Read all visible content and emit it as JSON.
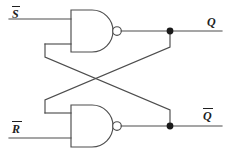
{
  "diagram": {
    "type": "logic-circuit-schematic",
    "colors": {
      "background": "#ffffff",
      "wire": "#4d4d4d",
      "junction": "#1a1a1a",
      "label_text": "#1f1f1f"
    },
    "inputs": [
      {
        "id": "s-bar",
        "label": "S",
        "overbar": true,
        "name": "S-bar (active-low set)"
      },
      {
        "id": "r-bar",
        "label": "R",
        "overbar": true,
        "name": "R-bar (active-low reset)"
      }
    ],
    "outputs": [
      {
        "id": "q",
        "label": "Q",
        "overbar": false,
        "name": "Q output"
      },
      {
        "id": "q-bar",
        "label": "Q",
        "overbar": true,
        "name": "Q-bar complementary output"
      }
    ],
    "gates": [
      {
        "id": "nand-top",
        "type": "NAND",
        "inputs": 2,
        "name": "Top NAND gate"
      },
      {
        "id": "nand-bottom",
        "type": "NAND",
        "inputs": 2,
        "name": "Bottom NAND gate"
      }
    ],
    "junctions": [
      {
        "id": "q-node",
        "name": "Q output junction dot"
      },
      {
        "id": "qbar-node",
        "name": "Q-bar output junction dot"
      }
    ],
    "nets": [
      {
        "id": "cross-q-to-bottom",
        "name": "Q feeds bottom NAND upper input"
      },
      {
        "id": "cross-qbar-to-top",
        "name": "Q-bar feeds top NAND lower input"
      }
    ]
  }
}
